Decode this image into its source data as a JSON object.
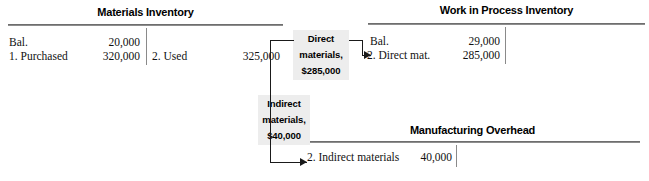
{
  "diagram": {
    "type": "t-account-flow",
    "accounts": [
      {
        "id": "materials-inventory",
        "title": "Materials Inventory",
        "debit_entries": [
          {
            "label": "Bal.",
            "amount": "20,000"
          },
          {
            "label": "1. Purchased",
            "amount": "320,000"
          }
        ],
        "credit_entries": [
          {
            "label": "2. Used",
            "amount": "325,000"
          }
        ]
      },
      {
        "id": "work-in-process-inventory",
        "title": "Work in Process Inventory",
        "debit_entries": [
          {
            "label": "Bal.",
            "amount": "29,000"
          },
          {
            "label": "2. Direct mat.",
            "amount": "285,000"
          }
        ],
        "credit_entries": []
      },
      {
        "id": "manufacturing-overhead",
        "title": "Manufacturing Overhead",
        "debit_entries": [
          {
            "label": "2. Indirect materials",
            "amount": "40,000"
          }
        ],
        "credit_entries": []
      }
    ],
    "callouts": [
      {
        "id": "direct-materials-callout",
        "line1": "Direct",
        "line2": "materials,",
        "line3": "$285,000"
      },
      {
        "id": "indirect-materials-callout",
        "line1": "Indirect",
        "line2": "materials,",
        "line3": "$40,000"
      }
    ],
    "colors": {
      "callout_background": "#ededed",
      "rule": "#8d8d8d",
      "connector": "#1a1a1a",
      "text": "#111111"
    }
  }
}
